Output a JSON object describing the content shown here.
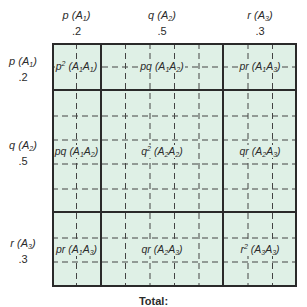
{
  "diagram": {
    "type": "punnett-square",
    "columns": [
      {
        "symbol": "p",
        "allele": "A",
        "sub": "1",
        "freq": ".2"
      },
      {
        "symbol": "q",
        "allele": "A",
        "sub": "2",
        "freq": ".5"
      },
      {
        "symbol": "r",
        "allele": "A",
        "sub": "3",
        "freq": ".3"
      }
    ],
    "rows": [
      {
        "symbol": "p",
        "allele": "A",
        "sub": "1",
        "freq": ".2"
      },
      {
        "symbol": "q",
        "allele": "A",
        "sub": "2",
        "freq": ".5"
      },
      {
        "symbol": "r",
        "allele": "A",
        "sub": "3",
        "freq": ".3"
      }
    ],
    "cells": [
      [
        "p² (A1A1)",
        "pq (A1A2)",
        "pr (A1A3)"
      ],
      [
        "pq (A1A2)",
        "q² (A2A2)",
        "qr (A2A3)"
      ],
      [
        "pr (A1A3)",
        "qr (A2A3)",
        "r² (A3A3)"
      ]
    ],
    "footer": "Total:",
    "colors": {
      "fill": "#dff0e6",
      "thick_line": "#2a2a2a",
      "dash_line": "#444444"
    }
  }
}
